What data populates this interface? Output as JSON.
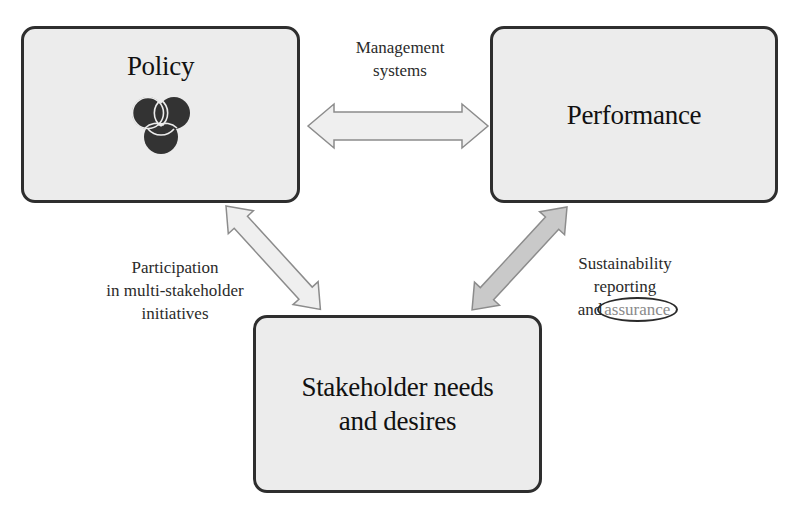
{
  "diagram": {
    "nodes": {
      "policy": {
        "title": "Policy",
        "icon": "venn-triquetra-icon"
      },
      "performance": {
        "title": "Performance"
      },
      "stakeholder": {
        "title_line1": "Stakeholder needs",
        "title_line2": "and desires"
      }
    },
    "edges": {
      "management": {
        "from": "Policy",
        "to": "Performance",
        "label_line1": "Management",
        "label_line2": "systems"
      },
      "participation": {
        "from": "Policy",
        "to": "Stakeholder needs and desires",
        "label_line1": "Participation",
        "label_line2": "in multi-stakeholder",
        "label_line3": "initiatives"
      },
      "sustainability": {
        "from": "Performance",
        "to": "Stakeholder needs and desires",
        "label_line1": "Sustainability",
        "label_line2": "reporting",
        "label_line3_prefix": "and",
        "label_line3_highlight": "assurance"
      }
    },
    "colors": {
      "box_fill": "#ececec",
      "box_border": "#2e2e2e",
      "arrow_light_fill": "#efefef",
      "arrow_dark_fill": "#c9c9c9",
      "arrow_stroke": "#8c8c8c",
      "highlight_text": "#8a8a8a"
    }
  }
}
